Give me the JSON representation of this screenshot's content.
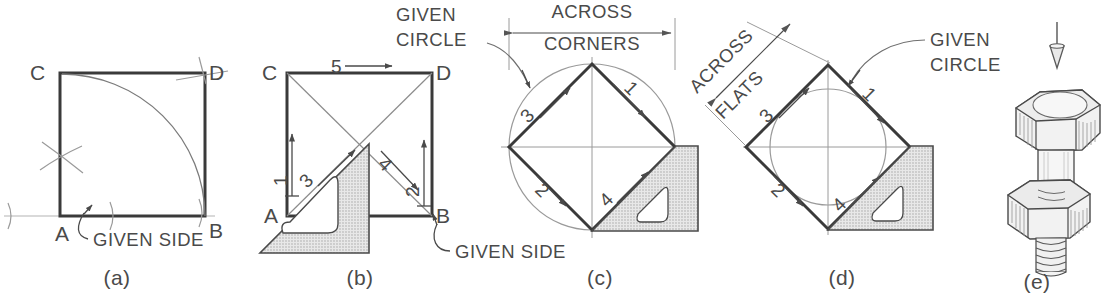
{
  "figure": {
    "background_color": "#ffffff",
    "ink_color": "#3a3a3a",
    "light_ink_color": "#8e8e8e",
    "tool_fill_color": "#d9d9d9"
  },
  "panels": [
    {
      "id": "a",
      "caption": "(a)",
      "method": "square-from-given-side-arc-method",
      "vertices": [
        {
          "name": "A",
          "label": "A",
          "position": "bottom-left"
        },
        {
          "name": "B",
          "label": "B",
          "position": "bottom-right"
        },
        {
          "name": "C",
          "label": "C",
          "position": "top-left"
        },
        {
          "name": "D",
          "label": "D",
          "position": "top-right"
        }
      ],
      "annotations": [
        {
          "name": "given-side-note",
          "text": "GIVEN SIDE"
        }
      ],
      "elements": [
        "square-outline",
        "quarter-arc-C-to-B",
        "construction-cross-left",
        "construction-tick-A",
        "construction-tick-B",
        "construction-tick-D",
        "baseline-extension"
      ]
    },
    {
      "id": "b",
      "caption": "(b)",
      "method": "square-from-given-side-triangle-method",
      "vertices": [
        {
          "name": "A",
          "label": "A",
          "position": "bottom-left"
        },
        {
          "name": "B",
          "label": "B",
          "position": "bottom-right"
        },
        {
          "name": "C",
          "label": "C",
          "position": "top-left"
        },
        {
          "name": "D",
          "label": "D",
          "position": "top-right"
        }
      ],
      "step_numbers": [
        {
          "label": "1",
          "direction": "up",
          "location": "left-inside"
        },
        {
          "label": "2",
          "direction": "up",
          "location": "right-inside"
        },
        {
          "label": "3",
          "direction": "up-right",
          "location": "lower-left-diagonal"
        },
        {
          "label": "4",
          "direction": "down-right",
          "location": "upper-right-diagonal"
        },
        {
          "label": "5",
          "direction": "right",
          "location": "top-edge"
        }
      ],
      "annotations": [
        {
          "name": "given-side-note",
          "text": "GIVEN SIDE"
        }
      ],
      "elements": [
        "square-outline",
        "diagonal-A-to-D",
        "diagonal-C-to-B",
        "triangle-tool-45deg",
        "triangle-tool-cutout"
      ]
    },
    {
      "id": "c",
      "caption": "(c)",
      "method": "square-across-corners-in-given-circle",
      "step_numbers": [
        {
          "label": "1",
          "direction": "down-right",
          "location": "upper-right-face"
        },
        {
          "label": "2",
          "direction": "down-right",
          "location": "lower-left-face"
        },
        {
          "label": "3",
          "direction": "up-right",
          "location": "upper-left-face"
        },
        {
          "label": "4",
          "direction": "up-right",
          "location": "lower-right-face"
        }
      ],
      "annotations": [
        {
          "name": "given-circle-note",
          "text_line1": "GIVEN",
          "text_line2": "CIRCLE"
        },
        {
          "name": "across-corners-dimension",
          "text_line1": "ACROSS",
          "text_line2": "CORNERS"
        }
      ],
      "elements": [
        "given-circle",
        "inscribed-diamond",
        "horizontal-center-line",
        "vertical-center-line",
        "dimension-line-double-arrow",
        "extension-line-left",
        "extension-line-right",
        "triangle-tool-45deg",
        "triangle-tool-cutout",
        "leader-curve"
      ]
    },
    {
      "id": "d",
      "caption": "(d)",
      "method": "square-across-flats-about-given-circle",
      "step_numbers": [
        {
          "label": "1",
          "direction": "down-right",
          "location": "upper-right-face"
        },
        {
          "label": "2",
          "direction": "down-right",
          "location": "lower-left-face"
        },
        {
          "label": "3",
          "direction": "up-right",
          "location": "upper-left-face"
        },
        {
          "label": "4",
          "direction": "up-right",
          "location": "lower-right-face"
        }
      ],
      "annotations": [
        {
          "name": "given-circle-note",
          "text_line1": "GIVEN",
          "text_line2": "CIRCLE"
        },
        {
          "name": "across-flats-dimension",
          "text_line1": "ACROSS",
          "text_line2": "FLATS",
          "rotated": true
        }
      ],
      "elements": [
        "given-circle",
        "circumscribed-diamond",
        "horizontal-center-line",
        "vertical-center-line",
        "dimension-line-diagonal",
        "triangle-tool-45deg",
        "triangle-tool-cutout",
        "leader-curve"
      ]
    },
    {
      "id": "e",
      "caption": "(e)",
      "subject": "hex-bolt-and-nut-assembly",
      "elements": [
        "viewing-direction-arrow",
        "bolt-head-hex",
        "bolt-shank",
        "threaded-section-upper",
        "hex-nut",
        "threaded-section-lower"
      ]
    }
  ]
}
